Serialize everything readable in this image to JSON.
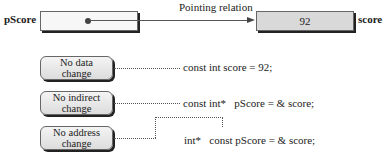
{
  "top": {
    "pointer_label": "pScore",
    "relation_label": "Pointing relation",
    "value": "92",
    "variable_label": "score"
  },
  "constraints": [
    {
      "label_line1": "No data",
      "label_line2": "change",
      "code": "const int score = 92;"
    },
    {
      "label_line1": "No indirect",
      "label_line2": "change",
      "code": "const int*   pScore = & score;"
    },
    {
      "label_line1": "No address",
      "label_line2": "change",
      "code": "int*   const pScore = & score;"
    }
  ],
  "colors": {
    "pointer_box_fill": "#f7f7f7",
    "value_box_fill": "#d9d9d9",
    "shadow": "#222222"
  }
}
